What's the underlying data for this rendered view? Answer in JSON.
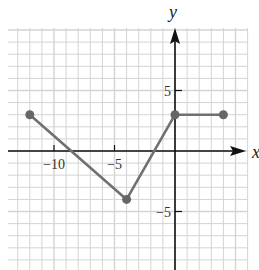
{
  "chart_data": {
    "type": "line",
    "title": "",
    "xlabel": "x",
    "ylabel": "y",
    "xlim": [
      -14,
      6
    ],
    "ylim": [
      -10,
      10
    ],
    "grid": true,
    "x_ticks": [
      {
        "value": -10,
        "label": "−10"
      },
      {
        "value": -5,
        "label": "−5"
      }
    ],
    "y_ticks": [
      {
        "value": 5,
        "label": "5"
      },
      {
        "value": -5,
        "label": "−5"
      }
    ],
    "series": [
      {
        "name": "piecewise",
        "points": [
          {
            "x": -12,
            "y": 3
          },
          {
            "x": -4,
            "y": -4
          },
          {
            "x": 0,
            "y": 3
          },
          {
            "x": 4,
            "y": 3
          }
        ],
        "color": "#707070"
      }
    ]
  },
  "colors": {
    "grid": "#d4d4d4",
    "axis": "#111111",
    "line": "#707070",
    "point": "#666666"
  }
}
